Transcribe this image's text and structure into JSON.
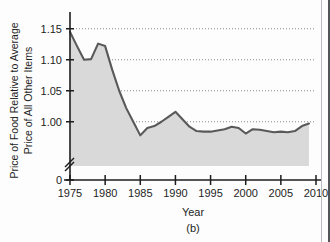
{
  "figure": {
    "panel_label": "(b)",
    "background_color": "#fdfdfd"
  },
  "chart_data": {
    "type": "area",
    "title": "",
    "subtitle": "",
    "xlabel": "Year",
    "ylabel": "Price of Food Relative to Average Price of All Other Items",
    "ylabel_line1": "Price of Food Relative to Average",
    "ylabel_line2": "Price of All Other Items",
    "xlim": [
      1975,
      2010
    ],
    "ylim": [
      0.9625,
      1.1625
    ],
    "y_axis_broken": true,
    "y_break_label": "0",
    "grid": "horizontal-dotted",
    "legend": "none",
    "xticks": [
      1975,
      1980,
      1985,
      1990,
      1995,
      2000,
      2005,
      2010
    ],
    "xtick_labels": [
      "1975",
      "1980",
      "1985",
      "1990",
      "1995",
      "2000",
      "2005",
      "2010"
    ],
    "yticks": [
      1.0,
      1.05,
      1.1,
      1.15
    ],
    "ytick_labels": [
      "1.00",
      "1.05",
      "1.10",
      "1.15"
    ],
    "series": [
      {
        "name": "Price of food relative to all other items",
        "line_color": "#595959",
        "fill_color": "#d9d9d9",
        "x": [
          1975,
          1976,
          1977,
          1978,
          1979,
          1980,
          1981,
          1982,
          1983,
          1984,
          1985,
          1986,
          1987,
          1988,
          1989,
          1990,
          1991,
          1992,
          1993,
          1994,
          1995,
          1996,
          1997,
          1998,
          1999,
          2000,
          2001,
          2002,
          2003,
          2004,
          2005,
          2006,
          2007,
          2008,
          2009
        ],
        "values": [
          1.145,
          1.122,
          1.1,
          1.101,
          1.126,
          1.122,
          1.084,
          1.05,
          1.022,
          1.0,
          0.978,
          0.99,
          0.993,
          1.0,
          1.008,
          1.016,
          1.004,
          0.992,
          0.985,
          0.984,
          0.984,
          0.986,
          0.988,
          0.992,
          0.99,
          0.981,
          0.988,
          0.987,
          0.985,
          0.983,
          0.984,
          0.983,
          0.985,
          0.993,
          0.997
        ]
      }
    ]
  },
  "axes": {
    "x_axis_name": "year-axis",
    "y_axis_name": "relative-price-axis"
  }
}
